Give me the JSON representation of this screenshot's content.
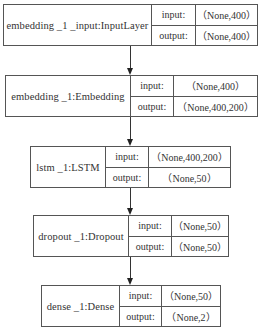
{
  "diagram": {
    "type": "keras-model-plot",
    "io_labels": {
      "input": "input:",
      "output": "output:"
    },
    "layers": [
      {
        "name": "embedding_1_input:InputLayer",
        "display_name": "embedding _1 _input:InputLayer",
        "input": "（None,400）",
        "output": "（None,400）"
      },
      {
        "name": "embedding_1:Embedding",
        "display_name": "embedding _1:Embedding",
        "input": "（None,400）",
        "output": "（None,400,200）"
      },
      {
        "name": "lstm_1:LSTM",
        "display_name": "lstm _1:LSTM",
        "input": "（None,400,200）",
        "output": "（None,50）"
      },
      {
        "name": "dropout_1:Dropout",
        "display_name": "dropout _1:Dropout",
        "input": "（None,50）",
        "output": "（None,50）"
      },
      {
        "name": "dense_1:Dense",
        "display_name": "dense _1:Dense",
        "input": "（None,50）",
        "output": "（None,2）"
      }
    ],
    "edges": [
      {
        "from": "embedding_1_input:InputLayer",
        "to": "embedding_1:Embedding"
      },
      {
        "from": "embedding_1:Embedding",
        "to": "lstm_1:LSTM"
      },
      {
        "from": "lstm_1:LSTM",
        "to": "dropout_1:Dropout"
      },
      {
        "from": "dropout_1:Dropout",
        "to": "dense_1:Dense"
      }
    ]
  }
}
